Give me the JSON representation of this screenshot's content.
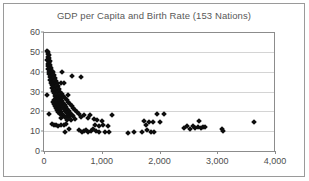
{
  "chart_data": {
    "type": "scatter",
    "title": "GDP per Capita and Birth Rate (153 Nations)",
    "xlabel": "",
    "ylabel": "",
    "xlim": [
      0,
      4000
    ],
    "ylim": [
      0,
      60
    ],
    "xticks": [
      0,
      1000,
      2000,
      3000,
      4000
    ],
    "xtick_labels": [
      "0",
      "1,000",
      "2,000",
      "3,000",
      "4,000"
    ],
    "yticks": [
      0,
      10,
      20,
      30,
      40,
      50,
      60
    ],
    "ytick_labels": [
      "0",
      "10",
      "20",
      "30",
      "40",
      "50",
      "60"
    ],
    "grid": "horizontal",
    "legend": "none",
    "marker": "diamond",
    "marker_color": "#0d0d0d",
    "n_points": 153,
    "series": [
      {
        "name": "Nations",
        "points": [
          [
            60,
            50.5
          ],
          [
            75,
            50.0
          ],
          [
            70,
            49.0
          ],
          [
            95,
            48.5
          ],
          [
            65,
            47.5
          ],
          [
            85,
            47.0
          ],
          [
            55,
            46.0
          ],
          [
            100,
            45.5
          ],
          [
            78,
            45.0
          ],
          [
            90,
            44.5
          ],
          [
            62,
            44.0
          ],
          [
            110,
            43.5
          ],
          [
            72,
            43.0
          ],
          [
            96,
            42.5
          ],
          [
            120,
            42.0
          ],
          [
            68,
            41.5
          ],
          [
            105,
            41.0
          ],
          [
            135,
            40.5
          ],
          [
            88,
            40.0
          ],
          [
            150,
            40.0
          ],
          [
            310,
            40.0
          ],
          [
            115,
            39.5
          ],
          [
            80,
            39.0
          ],
          [
            165,
            38.5
          ],
          [
            128,
            38.0
          ],
          [
            480,
            38.0
          ],
          [
            640,
            37.5
          ],
          [
            98,
            37.5
          ],
          [
            185,
            37.0
          ],
          [
            140,
            36.5
          ],
          [
            108,
            36.0
          ],
          [
            205,
            35.5
          ],
          [
            155,
            35.0
          ],
          [
            118,
            34.5
          ],
          [
            225,
            34.5
          ],
          [
            300,
            34.3
          ],
          [
            345,
            34.3
          ],
          [
            170,
            34.0
          ],
          [
            132,
            33.5
          ],
          [
            245,
            33.0
          ],
          [
            190,
            32.5
          ],
          [
            145,
            32.0
          ],
          [
            265,
            31.5
          ],
          [
            210,
            31.0
          ],
          [
            160,
            30.5
          ],
          [
            285,
            30.0
          ],
          [
            50,
            28.0
          ],
          [
            230,
            29.5
          ],
          [
            175,
            29.0
          ],
          [
            305,
            28.5
          ],
          [
            250,
            28.0
          ],
          [
            195,
            27.8
          ],
          [
            420,
            28.0
          ],
          [
            330,
            27.5
          ],
          [
            270,
            27.0
          ],
          [
            215,
            26.8
          ],
          [
            360,
            26.5
          ],
          [
            290,
            26.2
          ],
          [
            235,
            26.0
          ],
          [
            180,
            25.8
          ],
          [
            390,
            25.5
          ],
          [
            310,
            25.2
          ],
          [
            255,
            25.0
          ],
          [
            200,
            24.8
          ],
          [
            150,
            24.5
          ],
          [
            420,
            24.5
          ],
          [
            335,
            24.2
          ],
          [
            275,
            24.0
          ],
          [
            220,
            23.8
          ],
          [
            170,
            23.5
          ],
          [
            450,
            23.5
          ],
          [
            360,
            23.2
          ],
          [
            295,
            23.0
          ],
          [
            240,
            22.8
          ],
          [
            190,
            22.5
          ],
          [
            480,
            22.5
          ],
          [
            385,
            22.2
          ],
          [
            315,
            22.0
          ],
          [
            260,
            21.8
          ],
          [
            210,
            21.5
          ],
          [
            510,
            21.5
          ],
          [
            405,
            21.2
          ],
          [
            340,
            21.0
          ],
          [
            280,
            20.8
          ],
          [
            230,
            20.5
          ],
          [
            540,
            20.5
          ],
          [
            430,
            20.2
          ],
          [
            365,
            20.0
          ],
          [
            300,
            19.8
          ],
          [
            250,
            19.5
          ],
          [
            575,
            19.5
          ],
          [
            455,
            19.2
          ],
          [
            390,
            19.0
          ],
          [
            320,
            18.8
          ],
          [
            270,
            18.5
          ],
          [
            95,
            18.5
          ],
          [
            610,
            18.5
          ],
          [
            480,
            18.2
          ],
          [
            415,
            18.0
          ],
          [
            345,
            17.8
          ],
          [
            700,
            18.0
          ],
          [
            790,
            18.0
          ],
          [
            1180,
            18.2
          ],
          [
            1950,
            18.7
          ],
          [
            2080,
            18.5
          ],
          [
            505,
            17.5
          ],
          [
            440,
            17.2
          ],
          [
            370,
            17.0
          ],
          [
            295,
            16.8
          ],
          [
            640,
            17.0
          ],
          [
            760,
            16.5
          ],
          [
            860,
            16.2
          ],
          [
            530,
            16.0
          ],
          [
            465,
            15.8
          ],
          [
            395,
            15.5
          ],
          [
            910,
            15.5
          ],
          [
            1000,
            15.2
          ],
          [
            1740,
            15.0
          ],
          [
            1820,
            14.5
          ],
          [
            1880,
            14.8
          ],
          [
            2010,
            14.5
          ],
          [
            2690,
            15.0
          ],
          [
            3640,
            14.5
          ],
          [
            130,
            13.5
          ],
          [
            170,
            13.0
          ],
          [
            205,
            13.2
          ],
          [
            240,
            12.8
          ],
          [
            290,
            13.0
          ],
          [
            340,
            13.0
          ],
          [
            385,
            13.5
          ],
          [
            890,
            13.0
          ],
          [
            960,
            12.8
          ],
          [
            1030,
            13.0
          ],
          [
            1100,
            12.5
          ],
          [
            1770,
            13.0
          ],
          [
            2430,
            11.5
          ],
          [
            2480,
            12.5
          ],
          [
            2530,
            11.0
          ],
          [
            2580,
            12.8
          ],
          [
            2620,
            11.8
          ],
          [
            2660,
            12.0
          ],
          [
            2720,
            11.5
          ],
          [
            2760,
            12.0
          ],
          [
            2790,
            12.2
          ],
          [
            3080,
            11.2
          ],
          [
            3100,
            10.2
          ],
          [
            610,
            10.5
          ],
          [
            650,
            9.5
          ],
          [
            690,
            10.0
          ],
          [
            730,
            10.5
          ],
          [
            770,
            9.8
          ],
          [
            810,
            10.2
          ],
          [
            855,
            11.0
          ],
          [
            900,
            10.0
          ],
          [
            945,
            9.5
          ],
          [
            1050,
            9.5
          ],
          [
            1130,
            9.6
          ],
          [
            1460,
            9.3
          ],
          [
            1550,
            9.4
          ],
          [
            1700,
            9.6
          ],
          [
            1790,
            10.5
          ],
          [
            1850,
            9.5
          ],
          [
            1900,
            9.4
          ],
          [
            370,
            9.5
          ],
          [
            430,
            11.0
          ]
        ]
      }
    ]
  }
}
